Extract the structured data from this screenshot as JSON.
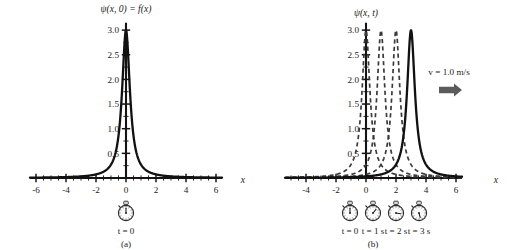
{
  "figure": {
    "background_color": "#ffffff",
    "ink_color": "#111111"
  },
  "panel_a": {
    "caption": "(a)",
    "title": "ψ(x, 0) = f(x)",
    "x_axis_label": "x",
    "clock_label": "t = 0",
    "clock_icon": "stopwatch-icon"
  },
  "panel_b": {
    "caption": "(b)",
    "title": "ψ(x, t)",
    "x_axis_label": "x",
    "velocity_label": "v = 1.0 m/s",
    "arrow_icon": "right-arrow-icon",
    "clock_icon": "stopwatch-icon",
    "clock_labels": [
      "t = 0",
      "t = 1 s",
      "t = 2 s",
      "t = 3 s"
    ]
  },
  "chart_data": [
    {
      "type": "line",
      "title": "ψ(x, 0) = f(x)",
      "xlabel": "x",
      "ylabel": "",
      "xlim": [
        -6.4,
        6.4
      ],
      "ylim": [
        0,
        3.15
      ],
      "xticks": [
        -6,
        -4,
        -2,
        0,
        2,
        4,
        6
      ],
      "xtick_labels": [
        "-6",
        "-4",
        "-2",
        "0",
        "2",
        "4",
        "6"
      ],
      "yticks": [
        0.5,
        1.0,
        1.5,
        2.0,
        2.5,
        3.0
      ],
      "ytick_labels": [
        "0.5",
        "1.0",
        "1.5",
        "2.0",
        "2.5",
        "3.0"
      ],
      "minor_tick_step": 0.25,
      "x_minor_tick_step": 0.5,
      "grid": false,
      "legend": false,
      "series": [
        {
          "name": "f(x) = 3/(10x² + 1)",
          "style": "solid",
          "peak_x": 0,
          "peak_y": 3.0,
          "amplitude": 3.0,
          "width_param": 10,
          "x": [
            -6.0,
            -5.0,
            -4.0,
            -3.0,
            -2.5,
            -2.0,
            -1.5,
            -1.25,
            -1.0,
            -0.8,
            -0.6,
            -0.5,
            -0.4,
            -0.3,
            -0.25,
            -0.2,
            -0.15,
            -0.1,
            -0.05,
            0.0,
            0.05,
            0.1,
            0.15,
            0.2,
            0.25,
            0.3,
            0.4,
            0.5,
            0.6,
            0.8,
            1.0,
            1.25,
            1.5,
            2.0,
            2.5,
            3.0,
            4.0,
            5.0,
            6.0
          ],
          "y": [
            0.008,
            0.012,
            0.019,
            0.033,
            0.047,
            0.073,
            0.13,
            0.18,
            0.27,
            0.41,
            0.68,
            0.86,
            1.15,
            1.5,
            1.71,
            1.88,
            2.18,
            2.4,
            2.73,
            3.0,
            2.73,
            2.4,
            2.18,
            1.88,
            1.71,
            1.5,
            1.15,
            0.86,
            0.68,
            0.41,
            0.27,
            0.18,
            0.13,
            0.073,
            0.047,
            0.033,
            0.019,
            0.012,
            0.008
          ]
        }
      ]
    },
    {
      "type": "line",
      "title": "ψ(x, t)",
      "xlabel": "x",
      "ylabel": "",
      "xlim": [
        -5.4,
        6.4
      ],
      "ylim": [
        0,
        3.15
      ],
      "xticks": [
        -4,
        -2,
        0,
        2,
        4,
        6
      ],
      "xtick_labels": [
        "-4",
        "-2",
        "0",
        "2",
        "4",
        "6"
      ],
      "yticks": [
        0.5,
        1.0,
        1.5,
        2.0,
        2.5,
        3.0
      ],
      "ytick_labels": [
        "0.5",
        "1.0",
        "1.5",
        "2.0",
        "2.5",
        "3.0"
      ],
      "minor_tick_step": 0.25,
      "x_minor_tick_step": 0.5,
      "grid": false,
      "legend": false,
      "annotations": [
        {
          "text": "v = 1.0 m/s",
          "x": 4.6,
          "y": 2.05
        },
        {
          "text": "right-arrow-icon",
          "x": 4.6,
          "y": 1.6
        }
      ],
      "series": [
        {
          "name": "t = 0 s",
          "style": "dashed",
          "peak_x": 0,
          "peak_y": 3.0,
          "amplitude": 3.0,
          "width_param": 10,
          "shift": 0
        },
        {
          "name": "t = 1 s",
          "style": "dashed",
          "peak_x": 1,
          "peak_y": 3.0,
          "amplitude": 3.0,
          "width_param": 10,
          "shift": 1
        },
        {
          "name": "t = 2 s",
          "style": "dashed",
          "peak_x": 2,
          "peak_y": 3.0,
          "amplitude": 3.0,
          "width_param": 10,
          "shift": 2
        },
        {
          "name": "t = 3 s",
          "style": "solid",
          "peak_x": 3,
          "peak_y": 3.0,
          "amplitude": 3.0,
          "width_param": 10,
          "shift": 3
        }
      ]
    }
  ]
}
